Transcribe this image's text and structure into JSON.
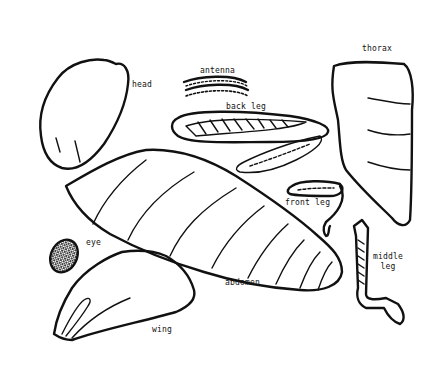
{
  "diagram": {
    "title": "",
    "type": "insect body parts (cut-out worksheet)",
    "parts": [
      {
        "id": "head",
        "label": "head"
      },
      {
        "id": "antenna",
        "label": "antenna"
      },
      {
        "id": "back-leg",
        "label": "back leg"
      },
      {
        "id": "thorax",
        "label": "thorax"
      },
      {
        "id": "front-leg",
        "label": "front leg"
      },
      {
        "id": "eye",
        "label": "eye"
      },
      {
        "id": "abdomen",
        "label": "abdomen"
      },
      {
        "id": "middle-leg",
        "label": "middle leg"
      },
      {
        "id": "wing",
        "label": "wing"
      }
    ],
    "colors": {
      "stroke": "#111111",
      "background": "#ffffff"
    }
  }
}
